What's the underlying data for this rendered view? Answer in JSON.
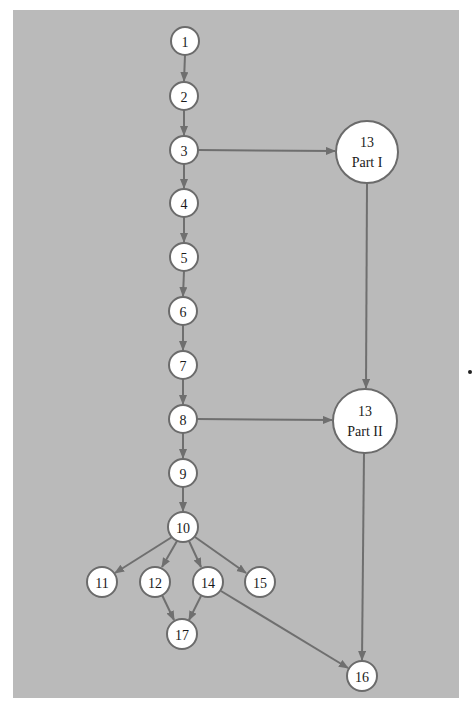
{
  "diagram": {
    "type": "chapter-dependency-graph",
    "colors": {
      "background": "#bababa",
      "node_fill": "#ffffff",
      "node_stroke": "#6b6b6b",
      "edge": "#6f6f6f",
      "text": "#1a1a1a"
    },
    "nodes": [
      {
        "id": "n1",
        "label": "1",
        "x": 185,
        "y": 41,
        "r": 14
      },
      {
        "id": "n2",
        "label": "2",
        "x": 184,
        "y": 96,
        "r": 14
      },
      {
        "id": "n3",
        "label": "3",
        "x": 184,
        "y": 150,
        "r": 14
      },
      {
        "id": "n4",
        "label": "4",
        "x": 184,
        "y": 203,
        "r": 14
      },
      {
        "id": "n5",
        "label": "5",
        "x": 184,
        "y": 257,
        "r": 14
      },
      {
        "id": "n6",
        "label": "6",
        "x": 183,
        "y": 311,
        "r": 14
      },
      {
        "id": "n7",
        "label": "7",
        "x": 183,
        "y": 365,
        "r": 14
      },
      {
        "id": "n8",
        "label": "8",
        "x": 183,
        "y": 419,
        "r": 14
      },
      {
        "id": "n9",
        "label": "9",
        "x": 183,
        "y": 473,
        "r": 14
      },
      {
        "id": "n10",
        "label": "10",
        "x": 183,
        "y": 527,
        "r": 15
      },
      {
        "id": "n11",
        "label": "11",
        "x": 102,
        "y": 582,
        "r": 15
      },
      {
        "id": "n12",
        "label": "12",
        "x": 155,
        "y": 582,
        "r": 15
      },
      {
        "id": "n14",
        "label": "14",
        "x": 208,
        "y": 582,
        "r": 15
      },
      {
        "id": "n15",
        "label": "15",
        "x": 260,
        "y": 582,
        "r": 15
      },
      {
        "id": "n17",
        "label": "17",
        "x": 182,
        "y": 634,
        "r": 15
      },
      {
        "id": "n13a",
        "label": "13",
        "sublabel": "Part I",
        "x": 367,
        "y": 152,
        "r": 31
      },
      {
        "id": "n13b",
        "label": "13",
        "sublabel": "Part II",
        "x": 365,
        "y": 421,
        "r": 32
      },
      {
        "id": "n16",
        "label": "16",
        "x": 362,
        "y": 676,
        "r": 15
      }
    ],
    "edges": [
      {
        "from": "1",
        "to": "2"
      },
      {
        "from": "2",
        "to": "3"
      },
      {
        "from": "3",
        "to": "4"
      },
      {
        "from": "3",
        "to": "13 Part I"
      },
      {
        "from": "4",
        "to": "5"
      },
      {
        "from": "5",
        "to": "6"
      },
      {
        "from": "6",
        "to": "7"
      },
      {
        "from": "7",
        "to": "8"
      },
      {
        "from": "8",
        "to": "9"
      },
      {
        "from": "8",
        "to": "13 Part II"
      },
      {
        "from": "13 Part I",
        "to": "13 Part II"
      },
      {
        "from": "9",
        "to": "10"
      },
      {
        "from": "10",
        "to": "11"
      },
      {
        "from": "10",
        "to": "12"
      },
      {
        "from": "10",
        "to": "14"
      },
      {
        "from": "10",
        "to": "15"
      },
      {
        "from": "12",
        "to": "17"
      },
      {
        "from": "14",
        "to": "17"
      },
      {
        "from": "14",
        "to": "16"
      },
      {
        "from": "13 Part II",
        "to": "16"
      }
    ]
  }
}
